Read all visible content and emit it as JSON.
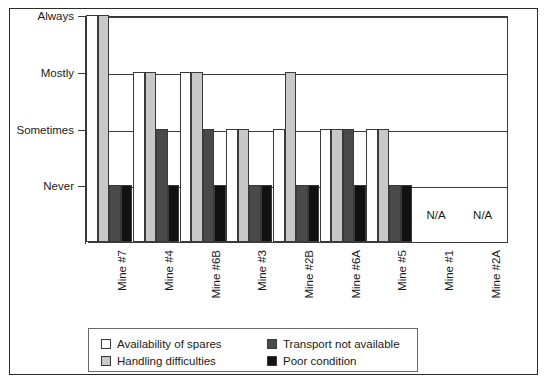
{
  "chart_data": {
    "type": "bar",
    "title": "",
    "subtitle": "",
    "xlabel": "",
    "ylabel": "",
    "grid": true,
    "legend_position": "bottom-left",
    "y_categories": [
      "Never",
      "Sometimes",
      "Mostly",
      "Always"
    ],
    "y_tick_labels": [
      "Never",
      "Sometimes",
      "Mostly",
      "Always"
    ],
    "ylim": [
      0,
      4
    ],
    "categories": [
      "Mine #7",
      "Mine #4",
      "Mine #6B",
      "Mine #3",
      "Mine #2B",
      "Mine #6A",
      "Mine #5",
      "Mine #1",
      "Mine #2A"
    ],
    "series": [
      {
        "name": "Availability of spares",
        "color": "#ffffff",
        "values": [
          "Always",
          "Mostly",
          "Mostly",
          "Sometimes",
          "Sometimes",
          "Sometimes",
          "Sometimes",
          null,
          null
        ],
        "numeric": [
          4,
          3,
          3,
          2,
          2,
          2,
          2,
          null,
          null
        ]
      },
      {
        "name": "Handling difficulties",
        "color": "#c8c8c8",
        "values": [
          "Always",
          "Mostly",
          "Mostly",
          "Sometimes",
          "Mostly",
          "Sometimes",
          "Sometimes",
          null,
          null
        ],
        "numeric": [
          4,
          3,
          3,
          2,
          3,
          2,
          2,
          null,
          null
        ]
      },
      {
        "name": "Transport not available",
        "color": "#4a4a4a",
        "values": [
          "Never",
          "Sometimes",
          "Sometimes",
          "Never",
          "Never",
          "Sometimes",
          "Never",
          null,
          null
        ],
        "numeric": [
          1,
          2,
          2,
          1,
          1,
          2,
          1,
          null,
          null
        ]
      },
      {
        "name": "Poor condition",
        "color": "#111111",
        "values": [
          "Never",
          "Never",
          "Never",
          "Never",
          "Never",
          "Never",
          "Never",
          null,
          null
        ],
        "numeric": [
          1,
          1,
          1,
          1,
          1,
          1,
          1,
          null,
          null
        ]
      }
    ],
    "annotations": [
      {
        "category": "Mine #1",
        "text": "N/A"
      },
      {
        "category": "Mine #2A",
        "text": "N/A"
      }
    ],
    "na_label": "N/A"
  },
  "legend": {
    "entries": [
      {
        "label": "Availability of spares",
        "swatch": "#ffffff"
      },
      {
        "label": "Handling difficulties",
        "swatch": "#c8c8c8"
      },
      {
        "label": "Transport not available",
        "swatch": "#4a4a4a"
      },
      {
        "label": "Poor condition",
        "swatch": "#111111"
      }
    ]
  }
}
